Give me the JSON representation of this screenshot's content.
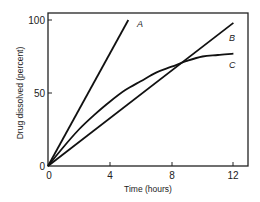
{
  "chart_data": {
    "type": "line",
    "title": "",
    "xlabel": "Time (hours)",
    "ylabel": "Drug dissolved (percent)",
    "xlim": [
      0,
      12.5
    ],
    "ylim": [
      0,
      105
    ],
    "x_ticks": [
      0,
      4,
      8,
      12
    ],
    "x_tick_labels": [
      "0",
      "4",
      "8",
      "12"
    ],
    "y_ticks": [
      0,
      50,
      100
    ],
    "y_tick_labels": [
      "0",
      "50",
      "100"
    ],
    "grid": false,
    "legend": "inline labels at line ends",
    "series": [
      {
        "name": "A",
        "label": "A",
        "x": [
          0,
          5.2
        ],
        "y": [
          0,
          100
        ]
      },
      {
        "name": "B",
        "label": "B",
        "x": [
          0,
          12
        ],
        "y": [
          0,
          98
        ]
      },
      {
        "name": "C",
        "label": "C",
        "x": [
          0,
          1,
          2,
          3,
          4,
          5,
          6,
          7,
          8,
          9,
          10,
          11,
          12
        ],
        "y": [
          0,
          13,
          25,
          35,
          44,
          52,
          58,
          64,
          68,
          72,
          75,
          76,
          77
        ]
      }
    ],
    "annotations": [
      "B and C intersect near 9 h, ~73%"
    ]
  },
  "colors": {
    "line": "#111111",
    "axis": "#222222",
    "background": "#ffffff"
  }
}
